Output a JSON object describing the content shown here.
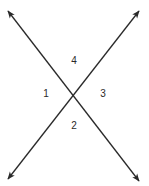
{
  "diagram": {
    "type": "intersecting-lines",
    "colors": {
      "line": "#2a2a2a",
      "background": "#ffffff"
    },
    "intersection": {
      "x": 73,
      "y": 94
    },
    "lines": [
      {
        "name": "line-descending",
        "from": {
          "x": 8,
          "y": 11
        },
        "to": {
          "x": 139,
          "y": 181
        },
        "arrows": "both"
      },
      {
        "name": "line-ascending",
        "from": {
          "x": 139,
          "y": 11
        },
        "to": {
          "x": 8,
          "y": 179
        },
        "arrows": "both"
      }
    ],
    "angles": [
      {
        "label": "1",
        "x": 46,
        "y": 94
      },
      {
        "label": "2",
        "x": 74,
        "y": 126
      },
      {
        "label": "3",
        "x": 103,
        "y": 94
      },
      {
        "label": "4",
        "x": 74,
        "y": 61
      }
    ]
  }
}
